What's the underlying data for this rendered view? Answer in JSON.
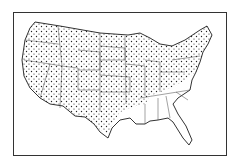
{
  "map": {
    "subject": "Contiguous United States",
    "style": "black-and-white outline with state borders",
    "dotted_region": "most states shaded with dot pattern",
    "undotted_states": [
      "Virginia",
      "North Carolina",
      "South Carolina",
      "Georgia",
      "Florida",
      "Alabama",
      "Mississippi",
      "Louisiana"
    ],
    "colors": {
      "line": "#333333",
      "dot": "#222222",
      "background": "#ffffff"
    }
  }
}
